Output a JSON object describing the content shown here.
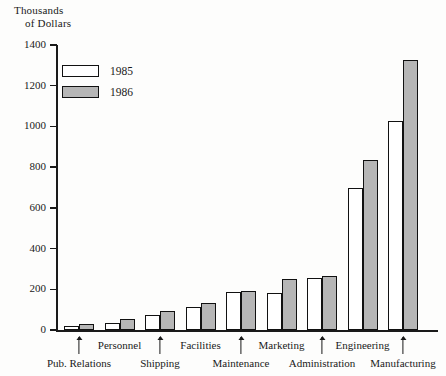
{
  "chart_data": {
    "type": "bar",
    "title": "",
    "ylabel": "Thousands of Dollars",
    "ylabel_line1": "Thousands",
    "ylabel_line2": "of Dollars",
    "xlabel": "",
    "ylim": [
      0,
      1400
    ],
    "ytick_step": 200,
    "yticks": [
      0,
      200,
      400,
      600,
      800,
      1000,
      1200,
      1400
    ],
    "ytick_labels": [
      "0",
      "200",
      "400",
      "600",
      "800",
      "1000",
      "1200",
      "1400"
    ],
    "grid": false,
    "legend_position": "inside-upper-left",
    "categories": [
      "Pub. Relations",
      "Personnel",
      "Shipping",
      "Facilities",
      "Maintenance",
      "Marketing",
      "Administration",
      "Engineering",
      "Manufacturing"
    ],
    "series": [
      {
        "name": "1985",
        "color": "#ffffff",
        "values": [
          20,
          35,
          75,
          115,
          185,
          180,
          255,
          700,
          1025
        ]
      },
      {
        "name": "1986",
        "color": "#b6b6b6",
        "values": [
          30,
          55,
          95,
          133,
          193,
          250,
          265,
          835,
          1325
        ]
      }
    ],
    "annotations": [
      {
        "text": "Pub. Relations",
        "points_to": "Pub. Relations",
        "row": "bottom"
      },
      {
        "text": "Personnel",
        "points_to": "Personnel",
        "row": "top"
      },
      {
        "text": "Shipping",
        "points_to": "Shipping",
        "row": "bottom"
      },
      {
        "text": "Facilities",
        "points_to": "Facilities",
        "row": "top"
      },
      {
        "text": "Maintenance",
        "points_to": "Maintenance",
        "row": "bottom"
      },
      {
        "text": "Marketing",
        "points_to": "Marketing",
        "row": "top"
      },
      {
        "text": "Administration",
        "points_to": "Administration",
        "row": "bottom"
      },
      {
        "text": "Engineering",
        "points_to": "Engineering",
        "row": "top"
      },
      {
        "text": "Manufacturing",
        "points_to": "Manufacturing",
        "row": "bottom"
      }
    ]
  },
  "axis": {
    "title_line1": "Thousands",
    "title_line2": "of Dollars",
    "ticks": [
      "1400",
      "1200",
      "1000",
      "800",
      "600",
      "400",
      "200",
      "0"
    ]
  },
  "legend": {
    "entries": [
      {
        "label": "1985",
        "swatch": "white"
      },
      {
        "label": "1986",
        "swatch": "gray"
      }
    ]
  },
  "colors": {
    "series_1985": "#ffffff",
    "series_1986": "#b6b6b6",
    "outline": "#111111",
    "axis": "#1a1a1a",
    "background": "#fdfdfc"
  },
  "footer": {
    "cut_text": ""
  }
}
